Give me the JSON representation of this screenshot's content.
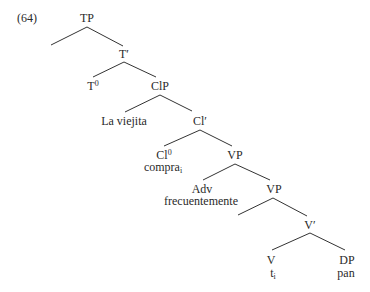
{
  "example_number": "(64)",
  "nodes": {
    "tp": "TP",
    "t_bar": "T′",
    "t0": "T",
    "t0_sup": "0",
    "clp": "ClP",
    "spec_clp": "La viejita",
    "cl_bar": "Cl′",
    "cl0": "Cl",
    "cl0_sup": "0",
    "cl0_word": "compra",
    "cl0_word_sub": "i",
    "vp1": "VP",
    "adv": "Adv",
    "adv_word": "frecuentemente",
    "vp2": "VP",
    "v_bar": "V′",
    "v": "V",
    "v_trace": "t",
    "v_trace_sub": "i",
    "dp": "DP",
    "dp_word": "pan"
  },
  "edges": [
    {
      "from": "TP",
      "to": "(empty spec)"
    },
    {
      "from": "TP",
      "to": "T′"
    },
    {
      "from": "T′",
      "to": "T0"
    },
    {
      "from": "T′",
      "to": "ClP"
    },
    {
      "from": "ClP",
      "to": "La viejita"
    },
    {
      "from": "ClP",
      "to": "Cl′"
    },
    {
      "from": "Cl′",
      "to": "Cl0"
    },
    {
      "from": "Cl′",
      "to": "VP"
    },
    {
      "from": "VP",
      "to": "Adv"
    },
    {
      "from": "VP",
      "to": "VP"
    },
    {
      "from": "VP",
      "to": "(empty spec)"
    },
    {
      "from": "VP",
      "to": "V′"
    },
    {
      "from": "V′",
      "to": "V"
    },
    {
      "from": "V′",
      "to": "DP"
    }
  ]
}
